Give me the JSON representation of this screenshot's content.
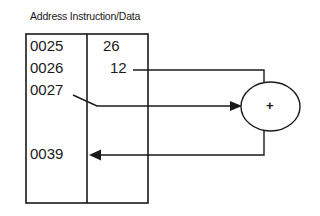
{
  "diagram": {
    "header": {
      "address_label": "Address",
      "data_label": "Instruction/Data"
    },
    "memory": [
      {
        "address": "0025",
        "value": "26"
      },
      {
        "address": "0026",
        "value": "12"
      },
      {
        "address": "0027",
        "value": ""
      },
      {
        "address": "0039",
        "value": ""
      }
    ],
    "adder": {
      "symbol": "+"
    },
    "connections": [
      {
        "from": "0026 value (12)",
        "to": "adder",
        "type": "line"
      },
      {
        "from": "0027 address",
        "to": "adder",
        "type": "arrow"
      },
      {
        "from": "adder",
        "to": "0039",
        "type": "arrow"
      }
    ],
    "colors": {
      "stroke": "#1a1a1a",
      "background": "#ffffff"
    }
  }
}
